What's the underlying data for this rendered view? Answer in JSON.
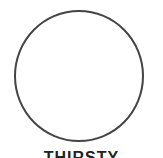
{
  "icon": {
    "shape": "circle-outline",
    "stroke_color": "#444444",
    "fill_color": "#ffffff"
  },
  "label": {
    "text": "THIRSTY"
  }
}
